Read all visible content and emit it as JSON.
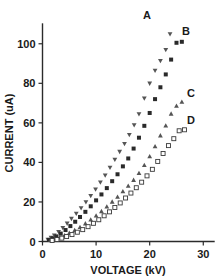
{
  "chart_data": {
    "type": "scatter",
    "title": "",
    "xlabel": "VOLTAGE (kV)",
    "ylabel": "CURRENT (uA)",
    "xlim": [
      0,
      32
    ],
    "ylim": [
      0,
      110
    ],
    "xticks": [
      0,
      10,
      20,
      30
    ],
    "yticks": [
      0,
      20,
      40,
      60,
      80,
      100
    ],
    "xtick_labels": [
      "0",
      "10",
      "20",
      "30"
    ],
    "ytick_labels": [
      "0",
      "20",
      "40",
      "60",
      "80",
      "100"
    ],
    "grid": false,
    "legend_position": "inline-right-of-curve",
    "series": [
      {
        "name": "A",
        "label": "A",
        "marker": "triangle-down",
        "color": "#555555",
        "x": [
          1.0,
          1.6,
          2.2,
          3.0,
          3.8,
          4.6,
          5.4,
          6.3,
          7.2,
          8.1,
          9.0,
          9.9,
          10.8,
          11.7,
          12.6,
          13.5,
          14.4,
          15.3,
          16.2,
          17.1,
          18.0,
          19.0,
          20.0,
          21.0,
          22.0,
          23.0,
          23.8
        ],
        "y": [
          1.0,
          2.0,
          3.2,
          5.0,
          7.0,
          9.2,
          11.6,
          14.2,
          17.0,
          20.0,
          23.2,
          26.5,
          30.0,
          33.5,
          37.5,
          41.5,
          45.5,
          49.5,
          54.0,
          59.0,
          64.5,
          72.5,
          80.0,
          86.5,
          91.5,
          97.0,
          105.0
        ]
      },
      {
        "name": "B",
        "label": "B",
        "marker": "square-filled",
        "color": "#2a2a2a",
        "x": [
          1.2,
          1.9,
          2.6,
          3.4,
          4.3,
          5.2,
          6.1,
          7.0,
          8.0,
          9.0,
          10.0,
          11.0,
          12.0,
          13.0,
          14.0,
          15.0,
          16.0,
          17.0,
          18.0,
          19.0,
          20.0,
          21.0,
          22.0,
          23.0,
          24.0,
          25.0,
          26.0
        ],
        "y": [
          0.8,
          1.6,
          2.6,
          4.0,
          5.8,
          7.8,
          10.0,
          12.4,
          15.0,
          17.8,
          20.8,
          23.8,
          27.0,
          30.5,
          34.0,
          38.0,
          42.0,
          47.0,
          52.5,
          58.5,
          65.0,
          72.0,
          78.0,
          84.5,
          92.0,
          100.5,
          101.0
        ]
      },
      {
        "name": "C",
        "label": "C",
        "marker": "triangle-up",
        "color": "#666666",
        "x": [
          1.5,
          2.3,
          3.2,
          4.1,
          5.0,
          6.0,
          7.0,
          8.0,
          9.0,
          10.0,
          11.0,
          12.0,
          13.0,
          14.0,
          15.0,
          16.0,
          17.0,
          18.0,
          19.0,
          20.0,
          21.0,
          22.0,
          23.0,
          24.0,
          25.0,
          26.0
        ],
        "y": [
          0.6,
          1.2,
          2.0,
          3.0,
          4.2,
          5.6,
          7.2,
          9.0,
          11.0,
          13.0,
          15.2,
          17.5,
          20.0,
          22.5,
          25.2,
          28.0,
          31.0,
          34.5,
          38.5,
          43.0,
          48.0,
          53.5,
          58.5,
          64.5,
          68.5,
          70.5
        ]
      },
      {
        "name": "D",
        "label": "D",
        "marker": "square-open",
        "color": "#6a6a6a",
        "x": [
          1.8,
          2.7,
          3.6,
          4.5,
          5.5,
          6.5,
          7.5,
          8.5,
          9.5,
          10.5,
          11.5,
          12.5,
          13.5,
          14.5,
          15.5,
          16.5,
          17.5,
          18.5,
          19.5,
          20.5,
          21.5,
          22.5,
          23.5,
          24.5,
          25.5,
          26.5
        ],
        "y": [
          0.5,
          1.0,
          1.7,
          2.5,
          3.5,
          4.7,
          6.0,
          7.5,
          9.2,
          11.0,
          13.0,
          15.0,
          17.2,
          19.5,
          22.0,
          24.5,
          27.2,
          30.0,
          33.2,
          36.5,
          40.5,
          44.5,
          48.5,
          52.0,
          56.0,
          56.5
        ]
      }
    ]
  },
  "labels": {
    "series_a": "A",
    "series_b": "B",
    "series_c": "C",
    "series_d": "D"
  }
}
